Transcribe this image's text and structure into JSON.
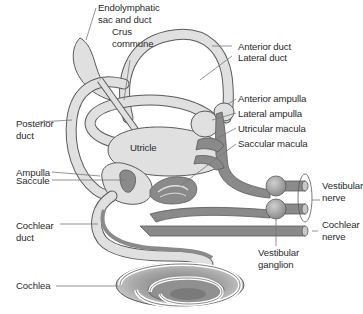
{
  "diagram": {
    "colors": {
      "membrane_light": "#e0e0e0",
      "membrane_outline": "#5a5a5a",
      "nerve_dark": "#8a8a8a",
      "ganglion": "#9a9a9a",
      "cochlea_shade": "#a8a8a8",
      "leader_line": "#777777",
      "text": "#2a2a2a"
    },
    "labels": [
      {
        "id": "endolymphatic",
        "text": "Endolymphatic\nsac and duct"
      },
      {
        "id": "crus",
        "text": "Crus\ncommune"
      },
      {
        "id": "anterior_duct",
        "text": "Anterior duct"
      },
      {
        "id": "lateral_duct",
        "text": "Lateral duct"
      },
      {
        "id": "anterior_ampulla",
        "text": "Anterior ampulla"
      },
      {
        "id": "lateral_ampulla",
        "text": "Lateral ampulla"
      },
      {
        "id": "utricular_macula",
        "text": "Utricular macula"
      },
      {
        "id": "saccular_macula",
        "text": "Saccular macula"
      },
      {
        "id": "posterior_duct",
        "text": "Posterior\nduct"
      },
      {
        "id": "utricle",
        "text": "Utricle"
      },
      {
        "id": "ampulla",
        "text": "Ampulla"
      },
      {
        "id": "saccule",
        "text": "Saccule"
      },
      {
        "id": "vestibular_nerve",
        "text": "Vestibular\nnerve"
      },
      {
        "id": "cochlear_duct",
        "text": "Cochlear\nduct"
      },
      {
        "id": "cochlear_nerve",
        "text": "Cochlear\nnerve"
      },
      {
        "id": "vestibular_ganglion",
        "text": "Vestibular\nganglion"
      },
      {
        "id": "cochlea",
        "text": "Cochlea"
      }
    ]
  }
}
